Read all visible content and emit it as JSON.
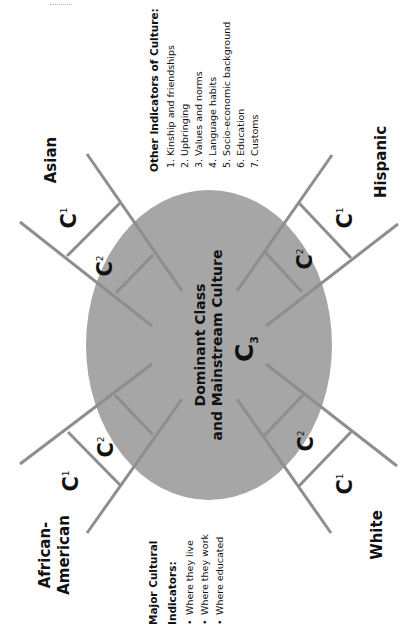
{
  "diagram": {
    "colors": {
      "ellipse_fill": "#a6a6a6",
      "ladder_stroke": "#8e8e8e",
      "text": "#111111",
      "background": "#ffffff"
    },
    "center": {
      "line1": "Dominant Class",
      "line2": "and Mainstream Culture",
      "level_label": "C",
      "level_sub": "3"
    },
    "groups": [
      {
        "id": "asian",
        "label": "Asian",
        "position": "top-left"
      },
      {
        "id": "hispanic",
        "label": "Hispanic",
        "position": "top-right"
      },
      {
        "id": "african-american",
        "label_line1": "African-",
        "label_line2": "American",
        "position": "bottom-left"
      },
      {
        "id": "white",
        "label": "White",
        "position": "bottom-right"
      }
    ],
    "levels": {
      "c1": {
        "main": "C",
        "sub": "1"
      },
      "c2": {
        "main": "C",
        "sub": "2"
      }
    },
    "other_indicators": {
      "title": "Other Indicators of Culture:",
      "items": [
        "1. Kinship and friendships",
        "2. Upbringing",
        "3. Values and norms",
        "4. Language habits",
        "5. Socio-economic background",
        "6. Education",
        "7. Customs"
      ]
    },
    "major_indicators": {
      "title_line1": "Major Cultural",
      "title_line2": "Indicators:",
      "bullet": "•",
      "items": [
        "Where they live",
        "Where they work",
        "Where educated"
      ]
    }
  }
}
